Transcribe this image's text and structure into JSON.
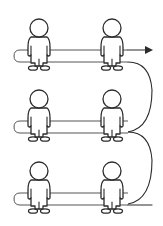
{
  "diagram": {
    "title": "",
    "colors": {
      "line": "#2b2b2b",
      "band": "#555555",
      "background": "#ffffff"
    },
    "rows": [
      {
        "row": 1,
        "people": 2,
        "arrow": "right"
      },
      {
        "row": 2,
        "people": 2,
        "arrow": "none"
      },
      {
        "row": 3,
        "people": 2,
        "arrow": "none"
      }
    ],
    "icons": [
      "person-icon",
      "arrow-right-icon"
    ]
  }
}
